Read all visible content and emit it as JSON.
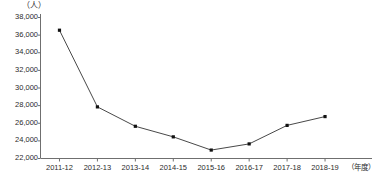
{
  "chart_data": {
    "type": "line",
    "title": "",
    "subtitle": "",
    "xlabel": "（年度）",
    "ylabel": "（人）",
    "categories": [
      "2011-12",
      "2012-13",
      "2013-14",
      "2014-15",
      "2015-16",
      "2016-17",
      "2017-18",
      "2018-19"
    ],
    "values": [
      36500,
      27800,
      25600,
      24400,
      22900,
      23600,
      25700,
      26700
    ],
    "series": [
      {
        "name": "",
        "values": [
          36500,
          27800,
          25600,
          24400,
          22900,
          23600,
          25700,
          26700
        ]
      }
    ],
    "ylim": [
      22000,
      38000
    ],
    "y_ticks": [
      22000,
      24000,
      26000,
      28000,
      30000,
      32000,
      34000,
      36000,
      38000
    ],
    "y_tick_labels": [
      "22,000",
      "24,000",
      "26,000",
      "28,000",
      "30,000",
      "32,000",
      "34,000",
      "36,000",
      "38,000"
    ],
    "grid": false,
    "legend": false,
    "legend_position": "none",
    "marker": "filled-square",
    "line_color": "#333333",
    "marker_color": "#111111",
    "axis_color": "#6f6f6f",
    "background_color": "#ffffff"
  },
  "axes": {
    "y_unit": "（人）",
    "x_unit": "（年度）"
  }
}
